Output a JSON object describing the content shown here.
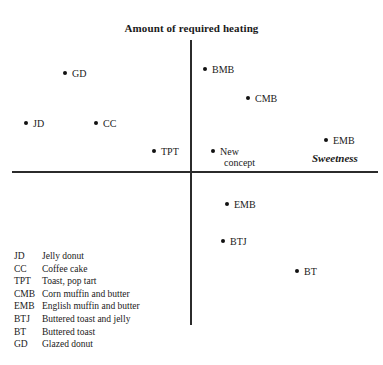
{
  "chart_data": {
    "type": "scatter",
    "title": "",
    "xlabel": "Sweetness",
    "ylabel": "Amount of required heating",
    "xlim": [
      -1,
      1
    ],
    "ylim": [
      -1,
      1
    ],
    "grid": false,
    "legend_position": "bottom-left",
    "axis_style": "crossed-quadrant-axes",
    "points": [
      {
        "abbr": "GD",
        "x": -0.7,
        "y": 0.77,
        "px": 63,
        "py": 68,
        "quadrant": "upper-left"
      },
      {
        "abbr": "JD",
        "x": -0.93,
        "y": 0.39,
        "px": 24,
        "py": 118,
        "quadrant": "upper-left"
      },
      {
        "abbr": "CC",
        "x": -0.53,
        "y": 0.39,
        "px": 94,
        "py": 118,
        "quadrant": "upper-left"
      },
      {
        "abbr": "TPT",
        "x": -0.2,
        "y": 0.18,
        "px": 152,
        "py": 146,
        "quadrant": "upper-left"
      },
      {
        "abbr": "BMB",
        "x": 0.08,
        "y": 0.8,
        "px": 203,
        "py": 64,
        "quadrant": "upper-right"
      },
      {
        "abbr": "CMB",
        "x": 0.31,
        "y": 0.58,
        "px": 246,
        "py": 93,
        "quadrant": "upper-right"
      },
      {
        "abbr": "New concept",
        "x": 0.12,
        "y": 0.18,
        "px": 211,
        "py": 146,
        "quadrant": "upper-right",
        "two_line": true,
        "line1": "New",
        "line2": "concept"
      },
      {
        "abbr": "EMB",
        "x": 0.73,
        "y": 0.26,
        "px": 324,
        "py": 135,
        "quadrant": "upper-right"
      },
      {
        "abbr": "EMB",
        "x": 0.2,
        "y": -0.22,
        "px": 225,
        "py": 199,
        "quadrant": "lower-right"
      },
      {
        "abbr": "BTJ",
        "x": 0.17,
        "y": -0.48,
        "px": 221,
        "py": 236,
        "quadrant": "lower-right"
      },
      {
        "abbr": "BT",
        "x": 0.57,
        "y": -0.7,
        "px": 295,
        "py": 266,
        "quadrant": "lower-right"
      }
    ],
    "legend": [
      {
        "abbr": "JD",
        "desc": "Jelly donut"
      },
      {
        "abbr": "CC",
        "desc": "Coffee cake"
      },
      {
        "abbr": "TPT",
        "desc": "Toast, pop tart"
      },
      {
        "abbr": "CMB",
        "desc": "Corn muffin and butter"
      },
      {
        "abbr": "EMB",
        "desc": "English muffin and butter"
      },
      {
        "abbr": "BTJ",
        "desc": "Buttered toast and jelly"
      },
      {
        "abbr": "BT",
        "desc": "Buttered toast"
      },
      {
        "abbr": "GD",
        "desc": "Glazed donut"
      }
    ]
  },
  "colors": {
    "axis": "#2b2b2b",
    "point": "#111111",
    "text": "#1a1a1a",
    "background": "#ffffff"
  }
}
